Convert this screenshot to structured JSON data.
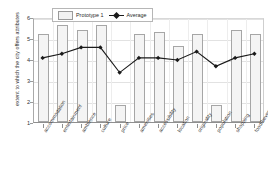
{
  "chart_data": {
    "type": "bar",
    "title": "",
    "xlabel": "",
    "ylabel": "extent to which the city offers attributes",
    "ylim": [
      1,
      6
    ],
    "yticks": [
      1,
      2,
      3,
      4,
      5,
      6
    ],
    "grid": true,
    "legend_position": "top-left",
    "categories": [
      "accommodation",
      "entertainment",
      "ambience",
      "culture",
      "price",
      "amenities",
      "accessibility",
      "location",
      "originality",
      "population",
      "shopping",
      "food/beverages"
    ],
    "series": [
      {
        "name": "Prototype 1",
        "type": "bar",
        "values": [
          5.2,
          5.6,
          5.4,
          5.6,
          1.8,
          5.2,
          5.3,
          4.6,
          5.2,
          1.8,
          5.4,
          5.2
        ]
      },
      {
        "name": "Average",
        "type": "line",
        "values": [
          4.1,
          4.3,
          4.6,
          4.6,
          3.4,
          4.1,
          4.1,
          4.0,
          4.4,
          3.7,
          4.1,
          4.3
        ]
      }
    ]
  },
  "legend": {
    "bar_label": "Prototype 1",
    "line_label": "Average"
  },
  "axis": {
    "y_title": "extent to which the city offers attributes"
  },
  "colors": {
    "bar_fill": "#f4f4f4",
    "bar_stroke": "#a6a6a6",
    "line": "#1a1a1a",
    "grid": "#e2e2e2",
    "text": "#2f2f2f"
  }
}
